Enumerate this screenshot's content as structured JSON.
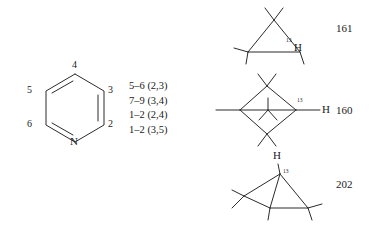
{
  "figure": {
    "background_color": "#ffffff",
    "line_color": "#2b2b2b",
    "text_color": "#1a1a1a"
  },
  "pyridine": {
    "nitrogen_label": "N",
    "position_labels": {
      "p2": "2",
      "p3": "3",
      "p4": "4",
      "p5": "5",
      "p6": "6"
    }
  },
  "coupling_list": {
    "rows": [
      "5–6 (2,3)",
      "7–9 (3,4)",
      "1–2 (2,4)",
      "1–2 (3,5)"
    ]
  },
  "structures": [
    {
      "id": "structure-161",
      "number": "161",
      "isotope_label": "13",
      "hydrogen_label": "H",
      "shape": "cyclopropane"
    },
    {
      "id": "structure-160",
      "number": "160",
      "isotope_label": "13",
      "hydrogen_label": "H",
      "shape": "bicyclobutane-diamond"
    },
    {
      "id": "structure-202",
      "number": "202",
      "isotope_label": "13",
      "hydrogen_label": "H",
      "shape": "bicyclobutane-apex"
    }
  ]
}
